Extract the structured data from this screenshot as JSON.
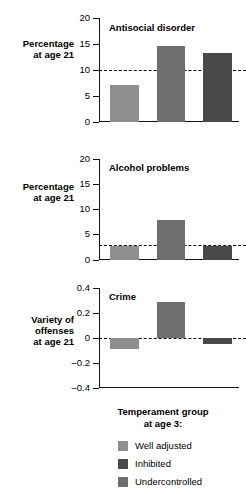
{
  "chart_data": {
    "type": "bar",
    "title": "",
    "xlabel": "Temperament group at age 3:",
    "categories": [
      "Well adjusted",
      "Inhibited",
      "Undercontrolled"
    ],
    "grid": false,
    "legend_position": "bottom",
    "panels": [
      {
        "title": "Antisocial disorder",
        "ylabel": "Percentage\nat age 21",
        "ylim": [
          0,
          20
        ],
        "yticks": [
          0,
          5,
          10,
          15,
          20
        ],
        "ytick_labels": [
          "0",
          "5",
          "10",
          "15",
          "20"
        ],
        "reference_line": 10,
        "values": [
          7.2,
          14.6,
          13.2
        ]
      },
      {
        "title": "Alcohol problems",
        "ylabel": "Percentage\nat age 21",
        "ylim": [
          0,
          20
        ],
        "yticks": [
          0,
          5,
          10,
          15,
          20
        ],
        "ytick_labels": [
          "0",
          "5",
          "10",
          "15",
          "20"
        ],
        "reference_line": 3,
        "values": [
          2.8,
          7.9,
          2.8
        ]
      },
      {
        "title": "Crime",
        "ylabel": "Variety of\noffenses\nat age 21",
        "ylim": [
          -0.4,
          0.4
        ],
        "yticks": [
          -0.4,
          -0.2,
          0,
          0.2,
          0.4
        ],
        "ytick_labels": [
          "-0.4",
          "-0.2",
          "0",
          "0.2",
          "0.4"
        ],
        "reference_line": 0,
        "values": [
          -0.09,
          0.285,
          -0.045
        ]
      }
    ],
    "series": [
      {
        "name": "Well adjusted",
        "values": [
          7.2,
          2.8,
          -0.09
        ]
      },
      {
        "name": "Inhibited",
        "values": [
          13.2,
          2.8,
          -0.045
        ]
      },
      {
        "name": "Undercontrolled",
        "values": [
          14.6,
          7.9,
          0.285
        ]
      }
    ]
  },
  "legend": {
    "caption": "Temperament group\nat age 3:",
    "items": [
      {
        "label": "Well adjusted",
        "color": "#8e8e8e"
      },
      {
        "label": "Inhibited",
        "color": "#494949"
      },
      {
        "label": "Undercontrolled",
        "color": "#6e6e6e"
      }
    ]
  },
  "bar_colors": [
    "#8e8e8e",
    "#6e6e6e",
    "#494949"
  ]
}
